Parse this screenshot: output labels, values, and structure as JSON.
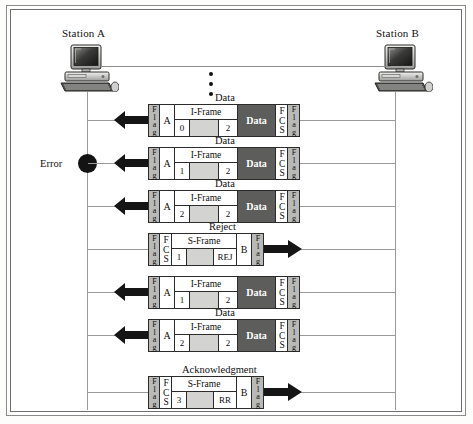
{
  "diagram": {
    "title_alt": "HDLC sliding-window error control with REJ",
    "stations": {
      "left": {
        "label": "Station A",
        "icon": "desktop-computer-icon"
      },
      "right": {
        "label": "Station B",
        "icon": "desktop-computer-icon"
      }
    },
    "ellipsis": "vertical-ellipsis-icon",
    "error_marker": {
      "label": "Error",
      "icon": "error-node-icon"
    },
    "cell_text": {
      "flag": "Flag",
      "fcs": "FCS",
      "data": "Data",
      "iframe": "I-Frame",
      "sframe": "S-Frame",
      "address_a": "A",
      "address_b": "B"
    },
    "colors": {
      "flag_fill": "#b9b9b7",
      "data_fill": "#5d5d5b",
      "pad_fill": "#d3d3d1",
      "line": "#9a9a98",
      "ink": "#0d0d0d"
    },
    "messages": [
      {
        "caption_above": "Data",
        "caption_below": "",
        "direction": "left",
        "type": "I-Frame",
        "address": "A",
        "ns": "0",
        "nr": "2",
        "payload": "Data",
        "arrow": "arrow-left-icon"
      },
      {
        "caption_above": "Data",
        "caption_below": "",
        "direction": "left",
        "type": "I-Frame",
        "address": "A",
        "ns": "1",
        "nr": "2",
        "payload": "Data",
        "arrow": "arrow-left-icon",
        "error": true
      },
      {
        "caption_above": "Data",
        "caption_below": "",
        "direction": "left",
        "type": "I-Frame",
        "address": "A",
        "ns": "2",
        "nr": "2",
        "payload": "Data",
        "arrow": "arrow-left-icon"
      },
      {
        "caption_above": "Reject",
        "caption_below": "",
        "direction": "right",
        "type": "S-Frame",
        "address": "B",
        "ns": "1",
        "code": "REJ",
        "arrow": "arrow-right-icon"
      },
      {
        "caption_above": "",
        "caption_below": "Data",
        "direction": "left",
        "type": "I-Frame",
        "address": "A",
        "ns": "1",
        "nr": "2",
        "payload": "Data",
        "arrow": "arrow-left-icon"
      },
      {
        "caption_above": "",
        "caption_below": "",
        "direction": "left",
        "type": "I-Frame",
        "address": "A",
        "ns": "2",
        "nr": "2",
        "payload": "Data",
        "arrow": "arrow-left-icon"
      },
      {
        "caption_above": "Acknowledgment",
        "caption_below": "",
        "direction": "right",
        "type": "S-Frame",
        "address": "B",
        "ns": "3",
        "code": "RR",
        "arrow": "arrow-right-icon"
      }
    ]
  }
}
